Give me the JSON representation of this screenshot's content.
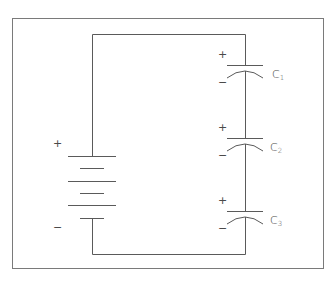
{
  "diagram": {
    "type": "circuit",
    "colors": {
      "line": "#5a5a5a",
      "frame": "#7a7a7a",
      "text": "#4a4a4a",
      "background": "#ffffff"
    },
    "battery": {
      "positive_label": "+",
      "negative_label": "−"
    },
    "capacitors": [
      {
        "name": "C",
        "sub": "1",
        "positive_label": "+",
        "negative_label": "−"
      },
      {
        "name": "C",
        "sub": "2",
        "positive_label": "+",
        "negative_label": "−"
      },
      {
        "name": "C",
        "sub": "3",
        "positive_label": "+",
        "negative_label": "−"
      }
    ]
  }
}
